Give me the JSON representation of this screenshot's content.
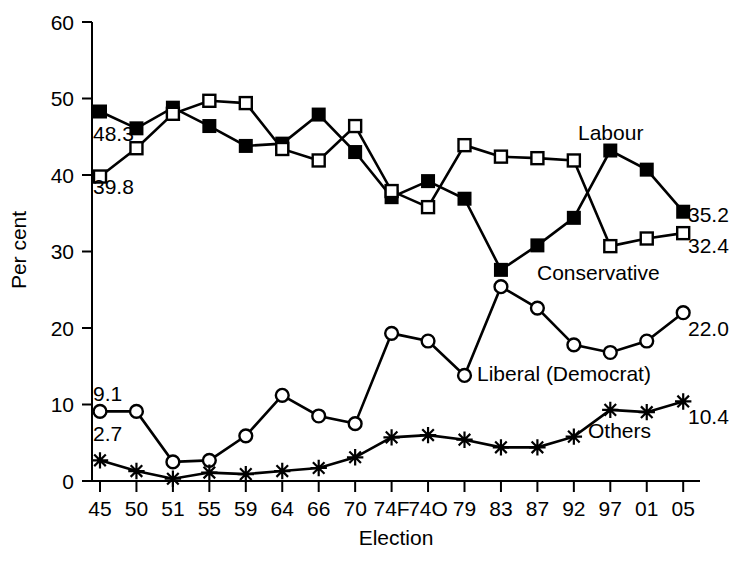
{
  "chart_data": {
    "type": "line",
    "title": "",
    "xlabel": "Election",
    "ylabel": "Per cent",
    "ylim": [
      0,
      60
    ],
    "yticks": [
      0,
      10,
      20,
      30,
      40,
      50,
      60
    ],
    "grid": false,
    "legend_position": "inline-annotations",
    "categories": [
      "45",
      "50",
      "51",
      "55",
      "59",
      "64",
      "66",
      "70",
      "74F",
      "74O",
      "79",
      "83",
      "87",
      "92",
      "97",
      "01",
      "05"
    ],
    "series": [
      {
        "name": "Labour",
        "marker": "filled-square",
        "values": [
          48.3,
          46.1,
          48.8,
          46.4,
          43.8,
          44.1,
          47.9,
          43.0,
          37.1,
          39.2,
          36.9,
          27.6,
          30.8,
          34.4,
          43.2,
          40.7,
          35.2
        ],
        "start_label": "48.3",
        "end_label": "35.2"
      },
      {
        "name": "Conservative",
        "marker": "open-square",
        "values": [
          39.8,
          43.5,
          48.0,
          49.7,
          49.4,
          43.4,
          41.9,
          46.4,
          37.9,
          35.8,
          43.9,
          42.4,
          42.2,
          41.9,
          30.7,
          31.7,
          32.4
        ],
        "start_label": "39.8",
        "end_label": "32.4"
      },
      {
        "name": "Liberal (Democrat)",
        "marker": "open-circle",
        "values": [
          9.1,
          9.1,
          2.5,
          2.7,
          5.9,
          11.2,
          8.5,
          7.5,
          19.3,
          18.3,
          13.8,
          25.4,
          22.6,
          17.8,
          16.8,
          18.3,
          22.0
        ],
        "start_label": "9.1",
        "end_label": "22.0"
      },
      {
        "name": "Others",
        "marker": "star",
        "values": [
          2.7,
          1.3,
          0.3,
          1.1,
          0.9,
          1.3,
          1.7,
          3.1,
          5.7,
          6.0,
          5.4,
          4.4,
          4.4,
          5.8,
          9.3,
          9.0,
          10.4
        ],
        "start_label": "2.7",
        "end_label": "10.4"
      }
    ],
    "annotations": [
      {
        "text": "Labour",
        "series": "Labour"
      },
      {
        "text": "Conservative",
        "series": "Conservative"
      },
      {
        "text": "Liberal (Democrat)",
        "series": "Liberal (Democrat)"
      },
      {
        "text": "Others",
        "series": "Others"
      }
    ],
    "colors": {
      "ink": "#000000",
      "background": "#ffffff"
    }
  },
  "labels": {
    "y_axis_title": "Per cent",
    "x_axis_title": "Election",
    "labour": "Labour",
    "conservative": "Conservative",
    "liberal": "Liberal (Democrat)",
    "others": "Others",
    "labour_start": "48.3",
    "labour_end": "35.2",
    "conservative_start": "39.8",
    "conservative_end": "32.4",
    "liberal_start": "9.1",
    "liberal_end": "22.0",
    "others_start": "2.7",
    "others_end": "10.4",
    "ytick_0": "0",
    "ytick_10": "10",
    "ytick_20": "20",
    "ytick_30": "30",
    "ytick_40": "40",
    "ytick_50": "50",
    "ytick_60": "60"
  }
}
